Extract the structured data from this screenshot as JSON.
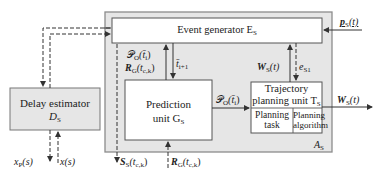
{
  "diagram": {
    "colors": {
      "outer_fill": "#e6e6e6",
      "outer_stroke": "#8c8c8c",
      "box_fill": "#ffffff",
      "delay_fill": "#e6e6e6",
      "line": "#333333"
    },
    "outer_box": {
      "label": "A",
      "label_sub": "S"
    },
    "event_generator": {
      "label": "Event generator E",
      "label_sub": "S"
    },
    "prediction_unit": {
      "line1": "Prediction",
      "line2": "unit G",
      "line2_sub": "S"
    },
    "trajectory_unit": {
      "line1": "Trajectory",
      "line2": "planning unit T",
      "line2_sub": "S",
      "cell_left_1": "Planning",
      "cell_left_2": "task",
      "cell_right_1": "Planning",
      "cell_right_2": "algorithm"
    },
    "delay_estimator": {
      "line1": "Delay estimator",
      "line2": "D",
      "line2_sub": "S"
    },
    "signals": {
      "p_s": {
        "main": "p",
        "sub": "S",
        "arg": "(t)"
      },
      "po_eg_to_pu": {
        "main": "𝒫",
        "sub": "O",
        "arg": "(t̄",
        "arg_sub": "i",
        "close": ")"
      },
      "rg_eg": {
        "main": "R",
        "sub": "G",
        "arg": "(t",
        "arg_sub": "c,k",
        "close": ")"
      },
      "t_next": {
        "main": "t̄",
        "sub": "i+1"
      },
      "ws_up": {
        "main": "W",
        "sub": "S",
        "arg": "(t)"
      },
      "e_s1": {
        "main": "e",
        "sub": "S1"
      },
      "po_pu_to_tp": {
        "main": "𝒫",
        "sub": "O",
        "arg": "(t̄",
        "arg_sub": "i",
        "close": ")"
      },
      "ws_out": {
        "main": "W",
        "sub": "S",
        "arg": "(t)"
      },
      "xp": {
        "main": "x",
        "sub": "P",
        "arg": "(s)"
      },
      "x": {
        "main": "x",
        "arg": "(s)"
      },
      "ss": {
        "main": "S",
        "sub": "S",
        "arg": "(t",
        "arg_sub": "c,k",
        "close": ")"
      },
      "rg_in": {
        "main": "R",
        "sub": "G",
        "arg": "(t",
        "arg_sub": "c,k",
        "close": ")"
      }
    }
  }
}
